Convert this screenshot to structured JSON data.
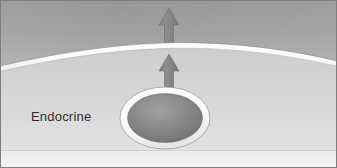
{
  "figure": {
    "width": 337,
    "height": 168,
    "label": "Endocrine"
  },
  "colors": {
    "frame_border": "#7e7e7e",
    "upper_compartment_top": "#9a9a9a",
    "upper_compartment_bottom": "#b4b4b4",
    "lower_compartment_top": "#c7c7c7",
    "lower_compartment_bottom": "#dcdcdc",
    "bottom_band": "#f0f0f0",
    "membrane_highlight": "#fbfbfb",
    "membrane_outline": "#8b8b8b",
    "cell_ring": "#fdfdfd",
    "cell_ring_outline": "#8d8d8d",
    "cell_body_light": "#9b9b9b",
    "cell_body_dark": "#6f6f6f",
    "arrow_fill": "#858585",
    "arrow_edge": "#6d6d6d",
    "label_text": "#2b2b2b"
  },
  "parts": {
    "frame": "figure-frame",
    "upper_compartment": "bloodstream-compartment",
    "membrane": "capillary-membrane",
    "lower_compartment": "tissue-compartment",
    "bottom_band": "bottom-margin-band",
    "cell": "endocrine-cell",
    "cell_nucleus": "cell-body",
    "arrow_upper": "hormone-arrow-upper",
    "arrow_lower": "hormone-arrow-lower"
  },
  "geometry": {
    "membrane_left_y": 66,
    "membrane_peak_x": 163,
    "membrane_peak_y": 43,
    "membrane_right_y": 61,
    "cell_center_x": 165,
    "cell_center_y": 118,
    "cell_rx": 45,
    "cell_ry": 31,
    "arrow_x": 169,
    "arrow_upper_top": 8,
    "arrow_upper_bottom": 45,
    "arrow_lower_top": 54,
    "arrow_lower_bottom": 96
  }
}
